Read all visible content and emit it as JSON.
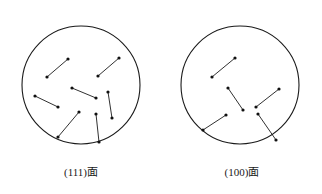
{
  "figure": {
    "background_color": "#ffffff",
    "stroke_color": "#1a1a1a",
    "dot_color": "#111111",
    "circle_stroke_width": 1.1,
    "segment_stroke_width": 0.9,
    "dot_radius": 1.6
  },
  "panels": [
    {
      "id": "panel-111",
      "caption": "(111)面",
      "circle": {
        "cx": 81,
        "cy": 85,
        "r": 59
      },
      "segments": [
        {
          "x1": 47,
          "y1": 77,
          "x2": 68,
          "y2": 59
        },
        {
          "x1": 98,
          "y1": 76,
          "x2": 119,
          "y2": 58
        },
        {
          "x1": 35,
          "y1": 96,
          "x2": 58,
          "y2": 107
        },
        {
          "x1": 72,
          "y1": 88,
          "x2": 96,
          "y2": 98
        },
        {
          "x1": 108,
          "y1": 92,
          "x2": 112,
          "y2": 118
        },
        {
          "x1": 58,
          "y1": 137,
          "x2": 79,
          "y2": 112
        },
        {
          "x1": 96,
          "y1": 114,
          "x2": 99,
          "y2": 142
        }
      ],
      "dots": [
        {
          "cx": 47,
          "cy": 77
        },
        {
          "cx": 68,
          "cy": 59
        },
        {
          "cx": 98,
          "cy": 76
        },
        {
          "cx": 119,
          "cy": 58
        },
        {
          "cx": 35,
          "cy": 96
        },
        {
          "cx": 58,
          "cy": 107
        },
        {
          "cx": 72,
          "cy": 88
        },
        {
          "cx": 96,
          "cy": 98
        },
        {
          "cx": 108,
          "cy": 92
        },
        {
          "cx": 112,
          "cy": 118
        },
        {
          "cx": 58,
          "cy": 137
        },
        {
          "cx": 79,
          "cy": 112
        },
        {
          "cx": 96,
          "cy": 114
        },
        {
          "cx": 99,
          "cy": 142
        }
      ]
    },
    {
      "id": "panel-100",
      "caption": "(100)面",
      "circle": {
        "cx": 240,
        "cy": 85,
        "r": 59
      },
      "segments": [
        {
          "x1": 212,
          "y1": 77,
          "x2": 235,
          "y2": 58
        },
        {
          "x1": 228,
          "y1": 88,
          "x2": 243,
          "y2": 110
        },
        {
          "x1": 256,
          "y1": 107,
          "x2": 279,
          "y2": 89
        },
        {
          "x1": 203,
          "y1": 130,
          "x2": 226,
          "y2": 115
        },
        {
          "x1": 258,
          "y1": 114,
          "x2": 276,
          "y2": 140
        }
      ],
      "dots": [
        {
          "cx": 212,
          "cy": 77
        },
        {
          "cx": 235,
          "cy": 58
        },
        {
          "cx": 228,
          "cy": 88
        },
        {
          "cx": 243,
          "cy": 110
        },
        {
          "cx": 256,
          "cy": 107
        },
        {
          "cx": 279,
          "cy": 89
        },
        {
          "cx": 203,
          "cy": 130
        },
        {
          "cx": 226,
          "cy": 115
        },
        {
          "cx": 258,
          "cy": 114
        },
        {
          "cx": 276,
          "cy": 140
        }
      ]
    }
  ]
}
